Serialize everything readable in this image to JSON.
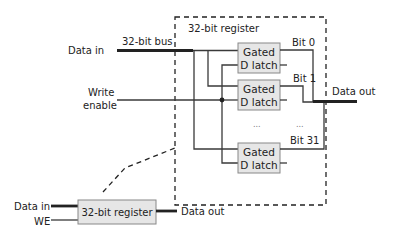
{
  "diagram": {
    "detail_box_label": "32-bit register",
    "inputs": {
      "data_in": "Data in",
      "bus_label": "32-bit bus",
      "write_enable_line1": "Write",
      "write_enable_line2": "enable"
    },
    "latches": [
      {
        "line1": "Gated",
        "line2": "D latch",
        "bit_label": "Bit 0"
      },
      {
        "line1": "Gated",
        "line2": "D latch",
        "bit_label": "Bit 1"
      },
      {
        "line1": "Gated",
        "line2": "D latch",
        "bit_label": "Bit 31"
      }
    ],
    "ellipsis": "...",
    "output": "Data out",
    "summary_block": {
      "label": "32-bit register",
      "data_in": "Data in",
      "we": "WE",
      "data_out": "Data out"
    },
    "colors": {
      "wire": "#3a3a3a",
      "bus": "#222222",
      "latch_fill": "#e6e6e6",
      "latch_stroke": "#888888"
    }
  }
}
